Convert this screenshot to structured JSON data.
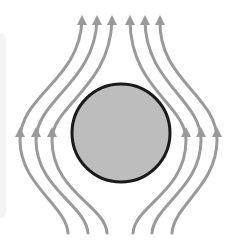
{
  "diagram": {
    "title": "",
    "colors": {
      "background": "#ffffff",
      "field_line": "#9a9a9a",
      "sphere_fill": "#bdbdbd",
      "sphere_outline": "#1a1a1a",
      "side_panel": "#f3f3f3"
    },
    "sphere": {
      "cx": 121,
      "cy": 133,
      "r": 49
    },
    "field_lines": [
      {
        "id": "left-outer",
        "d": "M68,233 C66,205 20,185 20,140 C20,95 80,80 82,20",
        "arrows": [
          [
            82,
            18
          ],
          [
            20,
            130
          ]
        ]
      },
      {
        "id": "left-middle",
        "d": "M88,233 C86,205 36,188 36,140 C36,100 95,82 97,20",
        "arrows": [
          [
            97,
            18
          ],
          [
            36,
            130
          ]
        ]
      },
      {
        "id": "left-inner",
        "d": "M107,233 C105,205 52,192 52,140 C52,105 110,88 112,20",
        "arrows": [
          [
            112,
            18
          ],
          [
            52,
            130
          ]
        ]
      },
      {
        "id": "right-inner",
        "d": "M133,233 C135,205 186,192 186,140 C186,105 130,88 130,20",
        "arrows": [
          [
            130,
            18
          ],
          [
            186,
            130
          ]
        ]
      },
      {
        "id": "right-middle",
        "d": "M152,233 C154,205 201,188 201,140 C201,100 145,82 145,20",
        "arrows": [
          [
            145,
            18
          ],
          [
            201,
            130
          ]
        ]
      },
      {
        "id": "right-outer",
        "d": "M172,233 C174,205 217,185 217,140 C217,95 158,80 160,20",
        "arrows": [
          [
            160,
            18
          ],
          [
            217,
            130
          ]
        ]
      }
    ]
  }
}
